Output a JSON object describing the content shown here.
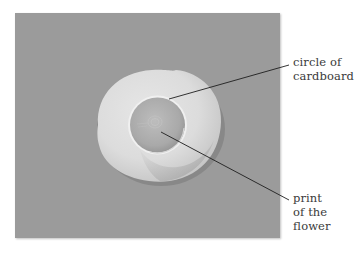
{
  "figure": {
    "colors": {
      "page_background": "#ffffff",
      "photo_background": "#9b9b9b",
      "cardboard_circle": "#dedede",
      "leader_line": "#1e1e1e",
      "label_text": "#3a3a3a"
    },
    "labels": [
      {
        "id": "circle-of-cardboard",
        "lines": [
          "circle of",
          "cardboard"
        ],
        "points_to": "rim of the cardboard circle"
      },
      {
        "id": "print-of-the-flower",
        "lines": [
          "print",
          "of the",
          "flower"
        ],
        "points_to": "center of the cup"
      }
    ]
  }
}
